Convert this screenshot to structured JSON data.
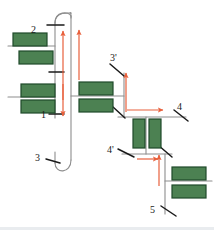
{
  "figure": {
    "background_color": "#ffffff",
    "colors": {
      "block_fill": "#4c8152",
      "block_stroke": "#1f4a2a",
      "channel_line": "#8d8d8d",
      "tick_line": "#1a1a1a",
      "arrow": "#e8603c",
      "label_text": "#1a1a1a",
      "bottom_edge": "#e9ecef"
    },
    "labels": [
      {
        "id": "label-2",
        "text": "2",
        "x": 31,
        "y": 25
      },
      {
        "id": "label-1",
        "text": "1",
        "x": 41,
        "y": 110
      },
      {
        "id": "label-3",
        "text": "3",
        "x": 38,
        "y": 156
      },
      {
        "id": "label-3prime",
        "text": "3'",
        "x": 112,
        "y": 57
      },
      {
        "id": "label-4",
        "text": "4",
        "x": 177,
        "y": 104
      },
      {
        "id": "label-4prime",
        "text": "4'",
        "x": 111,
        "y": 148
      },
      {
        "id": "label-5",
        "text": "5",
        "x": 152,
        "y": 208
      }
    ],
    "blocks": [
      {
        "id": "block-top-left-1",
        "x": 13,
        "y": 33,
        "w": 34,
        "h": 13,
        "orientation": "horizontal"
      },
      {
        "id": "block-top-left-2",
        "x": 19,
        "y": 51,
        "w": 34,
        "h": 13,
        "orientation": "horizontal"
      },
      {
        "id": "block-mid-left-1",
        "x": 21,
        "y": 84,
        "w": 34,
        "h": 13,
        "orientation": "horizontal"
      },
      {
        "id": "block-mid-left-2",
        "x": 21,
        "y": 100,
        "w": 34,
        "h": 13,
        "orientation": "horizontal"
      },
      {
        "id": "block-mid-center-1",
        "x": 79,
        "y": 82,
        "w": 34,
        "h": 13,
        "orientation": "horizontal"
      },
      {
        "id": "block-mid-center-2",
        "x": 79,
        "y": 99,
        "w": 34,
        "h": 13,
        "orientation": "horizontal"
      },
      {
        "id": "block-vertical-left",
        "x": 133,
        "y": 119,
        "w": 12,
        "h": 29,
        "orientation": "vertical"
      },
      {
        "id": "block-vertical-right",
        "x": 149,
        "y": 119,
        "w": 12,
        "h": 29,
        "orientation": "vertical"
      },
      {
        "id": "block-bottom-right-1",
        "x": 172,
        "y": 167,
        "w": 34,
        "h": 13,
        "orientation": "horizontal"
      },
      {
        "id": "block-bottom-right-2",
        "x": 172,
        "y": 185,
        "w": 34,
        "h": 13,
        "orientation": "horizontal"
      }
    ],
    "arrows": [
      {
        "id": "arrow-up-inner-top",
        "direction": "up",
        "x1": 63,
        "y1": 100,
        "x2": 63,
        "y2": 31
      },
      {
        "id": "arrow-up-outer-top",
        "direction": "up",
        "x1": 79,
        "y1": 80,
        "x2": 79,
        "y2": 30
      },
      {
        "id": "arrow-down-inner",
        "direction": "down",
        "x1": 63,
        "y1": 82,
        "x2": 63,
        "y2": 116
      },
      {
        "id": "arrow-up-3prime",
        "direction": "up",
        "x1": 126,
        "y1": 112,
        "x2": 126,
        "y2": 73
      },
      {
        "id": "arrow-right-to-4",
        "direction": "right",
        "x1": 127,
        "y1": 110,
        "x2": 163,
        "y2": 110
      },
      {
        "id": "arrow-right-to-4prime",
        "direction": "right",
        "x1": 137,
        "y1": 159,
        "x2": 158,
        "y2": 159
      },
      {
        "id": "arrow-up-from-5",
        "direction": "up",
        "x1": 159,
        "y1": 186,
        "x2": 159,
        "y2": 155
      }
    ],
    "channel_count": 7,
    "arrow_count": 7,
    "block_count": 10
  }
}
